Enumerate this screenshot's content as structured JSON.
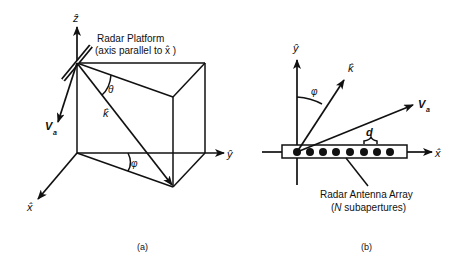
{
  "figure": {
    "panel_a": {
      "caption": "(a)",
      "axes": {
        "z": "ẑ",
        "y": "ŷ",
        "x": "x̂"
      },
      "platform_label_line1": "Radar Platform",
      "platform_label_line2": "(axis parallel to x̂ )",
      "velocity_label": "V",
      "velocity_sub": "a",
      "k_label": "k̂",
      "theta_label": "θ",
      "phi_label": "φ"
    },
    "panel_b": {
      "caption": "(b)",
      "axes": {
        "y": "ŷ",
        "x": "x̂"
      },
      "k_label": "k̂",
      "velocity_label": "V",
      "velocity_sub": "a",
      "phi_label": "φ",
      "spacing_label": "d",
      "array_label_line1": "Radar Antenna Array",
      "array_label_line2_italic": "N",
      "array_label_line2_rest": " subapertures)",
      "array_label_line2_open": "(",
      "subaperture_count_drawn": 8
    }
  }
}
